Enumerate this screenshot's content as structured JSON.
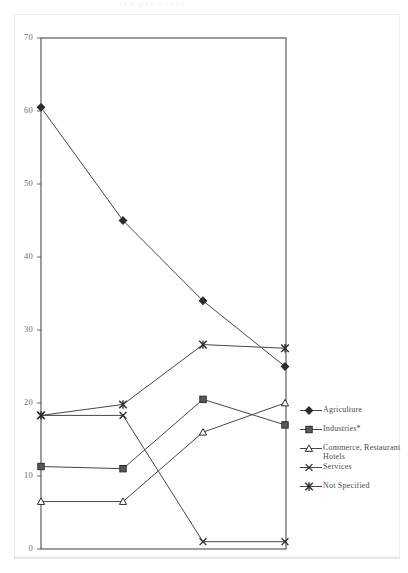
{
  "top_caption": "(in per cent)",
  "chart_data": {
    "type": "line",
    "title": "",
    "subtitle": "",
    "xlabel": "",
    "ylabel": "",
    "ylim": [
      0,
      70
    ],
    "yticks": [
      0,
      10,
      20,
      30,
      40,
      50,
      60,
      70
    ],
    "ytick_labels": [
      "0",
      "10",
      "20",
      "30",
      "40",
      "50",
      "60",
      "70"
    ],
    "grid": false,
    "legend_position": "right",
    "x": [
      1,
      2,
      3,
      4
    ],
    "categories": [
      "",
      "",
      "",
      ""
    ],
    "series": [
      {
        "name": "Agriculture",
        "marker": "filled-diamond",
        "values": [
          60.5,
          45.0,
          34.0,
          25.0
        ]
      },
      {
        "name": "Industries*",
        "marker": "filled-square",
        "values": [
          11.3,
          11.0,
          20.5,
          17.0
        ]
      },
      {
        "name": "Commerce, Restaurant Hotels",
        "marker": "open-triangle",
        "values": [
          6.5,
          6.5,
          16.0,
          20.0
        ]
      },
      {
        "name": "Services",
        "marker": "cross-x",
        "values": [
          18.3,
          18.3,
          1.0,
          1.0
        ]
      },
      {
        "name": "Not Specified",
        "marker": "asterisk",
        "values": [
          18.3,
          19.8,
          28.0,
          27.5
        ]
      }
    ]
  },
  "legend": {
    "items": [
      {
        "label": "Agriculture",
        "marker": "filled-diamond"
      },
      {
        "label": "Industries*",
        "marker": "filled-square"
      },
      {
        "label": "Commerce, Restaurant Hotels",
        "marker": "open-triangle"
      },
      {
        "label": "Services",
        "marker": "cross-x"
      },
      {
        "label": "Not Specified",
        "marker": "asterisk"
      }
    ]
  },
  "axis": {
    "y_min_label": "0",
    "y_max_label": "70"
  }
}
